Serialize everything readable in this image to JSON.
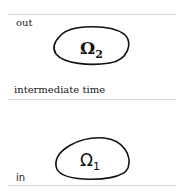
{
  "labels": {
    "top": "out",
    "middle": "intermediate time",
    "bottom": "in"
  },
  "regions": [
    {
      "symbol": "Ω",
      "subscript": "2"
    },
    {
      "symbol": "Ω",
      "subscript": "1"
    }
  ]
}
